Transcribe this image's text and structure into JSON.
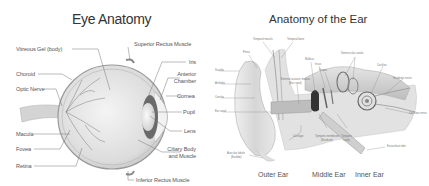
{
  "eye": {
    "title": "Eye Anatomy",
    "labels_left": [
      "Vitreous Gel (body)",
      "Choroid",
      "Optic Nerve",
      "Macula",
      "Fovea",
      "Retina"
    ],
    "labels_right": [
      "Superior Rectus Muscle",
      "Iris",
      "Anterior",
      "Chamber",
      "Cornea",
      "Pupil",
      "Lens",
      "Ciliary Body",
      "and Muscle",
      "Inferior Rectus Muscle"
    ]
  },
  "ear": {
    "title": "Anatomy of the Ear",
    "labels": [
      "Temporal muscle",
      "Temporal bone",
      "Pinna",
      "Scapha",
      "Antihelix",
      "Concha",
      "Ear canal",
      "External acoustic meatus",
      "(Ear canal)",
      "Malleus",
      "Incus",
      "Stapes",
      "Semicircular canals",
      "Cochlea",
      "Vestibular nerve",
      "Cochlear nerve",
      "Cartilage",
      "Tympanic membrane",
      "(Eardrum)",
      "Tympanic",
      "cavity",
      "Eustachian tube",
      "Auricular lobule",
      "(Earlobe)"
    ],
    "sections": [
      "Outer Ear",
      "Middle Ear",
      "Inner Ear"
    ]
  },
  "colors": {
    "line": "#666666",
    "tissue": "#d9d9d9",
    "dark": "#555555"
  }
}
